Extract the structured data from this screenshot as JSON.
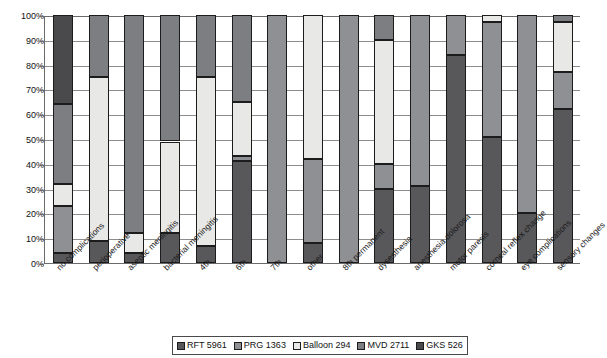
{
  "chart_data": {
    "type": "bar",
    "subtype": "stacked-bar-100-percent",
    "title": "",
    "subtitle": "",
    "xlabel": "",
    "ylabel": "",
    "grid": true,
    "legend_position": "bottom",
    "ylim": [
      0,
      100
    ],
    "y_unit": "%",
    "ytick_labels": [
      "0%",
      "10%",
      "20%",
      "30%",
      "40%",
      "50%",
      "60%",
      "70%",
      "80%",
      "90%",
      "100%"
    ],
    "ytick_values": [
      0,
      10,
      20,
      30,
      40,
      50,
      60,
      70,
      80,
      90,
      100
    ],
    "categories": [
      "no complications",
      "perioperative",
      "aseptic meningitis",
      "bacterial meningitis",
      "4th",
      "6th",
      "7th",
      "other",
      "8th permanent",
      "dysesthesia",
      "anesthesia dolorosa",
      "motor paresis",
      "corneal reflex change",
      "eye complications",
      "sensory changes"
    ],
    "series": [
      {
        "name": "RFT 5961",
        "color": "#58585a",
        "values": [
          4,
          9,
          4,
          12,
          7,
          41,
          0,
          8,
          0,
          30,
          31,
          84,
          51,
          20,
          62
        ]
      },
      {
        "name": "PRG 1363",
        "color": "#8f9093",
        "values": [
          19,
          0,
          0,
          0,
          0,
          2,
          100,
          34,
          100,
          10,
          69,
          16,
          46,
          80,
          15
        ]
      },
      {
        "name": "Balloon 294",
        "color": "#e8e8e6",
        "values": [
          9,
          66,
          8,
          37,
          68,
          22,
          0,
          58,
          0,
          50,
          0,
          0,
          3,
          0,
          20
        ]
      },
      {
        "name": "MVD 2711",
        "color": "#7d7e81",
        "values": [
          32,
          25,
          88,
          51,
          25,
          35,
          0,
          0,
          0,
          10,
          0,
          0,
          0,
          0,
          3
        ]
      },
      {
        "name": "GKS 526",
        "color": "#4a4a4c",
        "values": [
          36,
          0,
          0,
          0,
          0,
          0,
          0,
          0,
          0,
          0,
          0,
          0,
          0,
          0,
          0
        ]
      }
    ]
  },
  "legend": {
    "items": [
      {
        "label": "RFT 5961",
        "color": "#58585a"
      },
      {
        "label": "PRG 1363",
        "color": "#8f9093"
      },
      {
        "label": "Balloon 294",
        "color": "#e8e8e6"
      },
      {
        "label": "MVD 2711",
        "color": "#7d7e81"
      },
      {
        "label": "GKS 526",
        "color": "#4a4a4c"
      }
    ]
  }
}
